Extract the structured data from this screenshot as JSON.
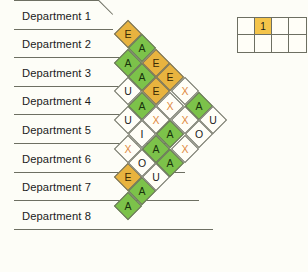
{
  "chart_data": {
    "type": "heatmap",
    "title": "",
    "xlabel": "",
    "ylabel": "",
    "chart_kind": "relationship-chart",
    "departments": [
      "Department 1",
      "Department 2",
      "Department 3",
      "Department 4",
      "Department 5",
      "Department 6",
      "Department 7",
      "Department 8"
    ],
    "rating_codes": [
      "A",
      "E",
      "I",
      "O",
      "U",
      "X"
    ],
    "rating_colors": {
      "A": "#7cc24a",
      "E": "#e8b33f",
      "I": "#fffef7",
      "O": "#fffef7",
      "U": "#fffef7",
      "X": "#fffef7"
    },
    "diagonals": [
      {
        "offset": 1,
        "values": [
          "E",
          "A",
          "U",
          "U",
          "X",
          "E",
          "A"
        ]
      },
      {
        "offset": 2,
        "values": [
          "A",
          "A",
          "A",
          "I",
          "O",
          "A"
        ]
      },
      {
        "offset": 3,
        "values": [
          "E",
          "E",
          "X",
          "A",
          "U"
        ]
      },
      {
        "offset": 4,
        "values": [
          "E",
          "X",
          "A",
          "A"
        ]
      },
      {
        "offset": 5,
        "values": [
          "X",
          "X",
          "X"
        ]
      },
      {
        "offset": 6,
        "values": [
          "A",
          "O"
        ]
      },
      {
        "offset": 7,
        "values": [
          "U"
        ]
      }
    ],
    "pairs": [
      {
        "from": "Department 1",
        "to": "Department 2",
        "rating": "E"
      },
      {
        "from": "Department 2",
        "to": "Department 3",
        "rating": "A"
      },
      {
        "from": "Department 3",
        "to": "Department 4",
        "rating": "U"
      },
      {
        "from": "Department 4",
        "to": "Department 5",
        "rating": "U"
      },
      {
        "from": "Department 5",
        "to": "Department 6",
        "rating": "X"
      },
      {
        "from": "Department 6",
        "to": "Department 7",
        "rating": "E"
      },
      {
        "from": "Department 7",
        "to": "Department 8",
        "rating": "A"
      },
      {
        "from": "Department 1",
        "to": "Department 3",
        "rating": "A"
      },
      {
        "from": "Department 2",
        "to": "Department 4",
        "rating": "A"
      },
      {
        "from": "Department 3",
        "to": "Department 5",
        "rating": "A"
      },
      {
        "from": "Department 4",
        "to": "Department 6",
        "rating": "I"
      },
      {
        "from": "Department 5",
        "to": "Department 7",
        "rating": "O"
      },
      {
        "from": "Department 6",
        "to": "Department 8",
        "rating": "A"
      },
      {
        "from": "Department 1",
        "to": "Department 4",
        "rating": "E"
      },
      {
        "from": "Department 2",
        "to": "Department 5",
        "rating": "E"
      },
      {
        "from": "Department 3",
        "to": "Department 6",
        "rating": "X"
      },
      {
        "from": "Department 4",
        "to": "Department 7",
        "rating": "A"
      },
      {
        "from": "Department 5",
        "to": "Department 8",
        "rating": "U"
      },
      {
        "from": "Department 1",
        "to": "Department 5",
        "rating": "E"
      },
      {
        "from": "Department 2",
        "to": "Department 6",
        "rating": "X"
      },
      {
        "from": "Department 3",
        "to": "Department 7",
        "rating": "A"
      },
      {
        "from": "Department 4",
        "to": "Department 8",
        "rating": "A"
      },
      {
        "from": "Department 1",
        "to": "Department 6",
        "rating": "X"
      },
      {
        "from": "Department 2",
        "to": "Department 7",
        "rating": "X"
      },
      {
        "from": "Department 3",
        "to": "Department 8",
        "rating": "X"
      },
      {
        "from": "Department 1",
        "to": "Department 7",
        "rating": "A"
      },
      {
        "from": "Department 2",
        "to": "Department 8",
        "rating": "O"
      },
      {
        "from": "Department 1",
        "to": "Department 8",
        "rating": "U"
      }
    ]
  },
  "legend": {
    "rows": 2,
    "cols": 4,
    "cells": [
      {
        "text": "",
        "highlight": false
      },
      {
        "text": "1",
        "highlight": true
      },
      {
        "text": "",
        "highlight": false
      },
      {
        "text": "",
        "highlight": false
      },
      {
        "text": "",
        "highlight": false
      },
      {
        "text": "",
        "highlight": false
      },
      {
        "text": "",
        "highlight": false
      },
      {
        "text": "",
        "highlight": false
      }
    ],
    "highlight_color": "#f4c44a"
  }
}
